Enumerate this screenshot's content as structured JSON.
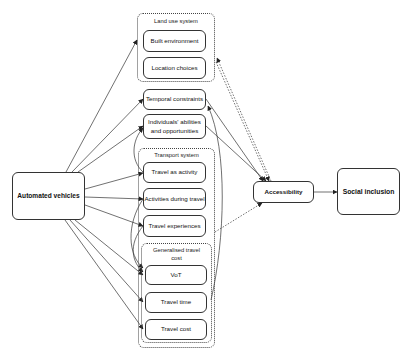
{
  "diagram": {
    "source_node": "Automated vehicles",
    "groups": {
      "land_use": {
        "title": "Land use system",
        "items": [
          "Built environment",
          "Location choices"
        ]
      },
      "transport": {
        "title": "Transport system",
        "items": [
          "Travel as activity",
          "Activities during travel",
          "Travel experiences"
        ]
      },
      "gen_cost": {
        "title": "Generalised travel cost",
        "items": [
          "VoT",
          "Travel time",
          "Travel cost"
        ]
      }
    },
    "standalone": [
      "Temporal constraints",
      "Individuals' abilities and opportunities"
    ],
    "accessibility": "Accessibility",
    "outcome": "Social inclusion",
    "edges": [
      {
        "from": "Automated vehicles",
        "to": "Land use system",
        "style": "solid"
      },
      {
        "from": "Automated vehicles",
        "to": "Temporal constraints",
        "style": "solid"
      },
      {
        "from": "Automated vehicles",
        "to": "Individuals' abilities and opportunities",
        "style": "solid"
      },
      {
        "from": "Automated vehicles",
        "to": "Travel as activity",
        "style": "solid"
      },
      {
        "from": "Automated vehicles",
        "to": "Activities during travel",
        "style": "solid"
      },
      {
        "from": "Automated vehicles",
        "to": "Travel experiences",
        "style": "solid"
      },
      {
        "from": "Automated vehicles",
        "to": "VoT",
        "style": "solid"
      },
      {
        "from": "Automated vehicles",
        "to": "Travel time",
        "style": "solid"
      },
      {
        "from": "Automated vehicles",
        "to": "Travel cost",
        "style": "solid"
      },
      {
        "from": "Temporal constraints",
        "to": "Accessibility",
        "style": "solid"
      },
      {
        "from": "Individuals' abilities and opportunities",
        "to": "Accessibility",
        "style": "solid"
      },
      {
        "from": "Land use system",
        "to": "Accessibility",
        "style": "dotted"
      },
      {
        "from": "Accessibility",
        "to": "Land use system",
        "style": "dotted"
      },
      {
        "from": "Transport system",
        "to": "Accessibility",
        "style": "dotted"
      },
      {
        "from": "Travel time",
        "to": "Accessibility",
        "style": "solid"
      },
      {
        "from": "Accessibility",
        "to": "Social inclusion",
        "style": "solid"
      }
    ]
  }
}
